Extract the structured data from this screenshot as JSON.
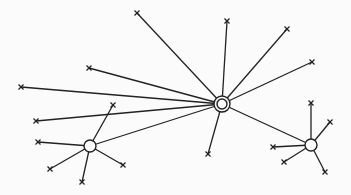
{
  "diagram": {
    "type": "hub-and-spoke network",
    "colors": {
      "stroke": "#222222",
      "background": "#fbfbfb"
    },
    "hubs": [
      {
        "id": "central",
        "x": 222,
        "y": 104,
        "style": "double-circle"
      },
      {
        "id": "left",
        "x": 90,
        "y": 146,
        "style": "circle"
      },
      {
        "id": "right",
        "x": 311,
        "y": 145,
        "style": "circle"
      }
    ],
    "edges": [
      {
        "from": "central",
        "to": [
          137,
          13
        ]
      },
      {
        "from": "central",
        "to": [
          89,
          68
        ]
      },
      {
        "from": "central",
        "to": [
          21,
          87
        ]
      },
      {
        "from": "central",
        "to": [
          36,
          121
        ]
      },
      {
        "from": "central",
        "to": [
          227,
          21
        ]
      },
      {
        "from": "central",
        "to": [
          287,
          29
        ]
      },
      {
        "from": "central",
        "to": [
          312,
          62
        ]
      },
      {
        "from": "central",
        "to": [
          208,
          154
        ]
      },
      {
        "from": "central",
        "to": "left"
      },
      {
        "from": "central",
        "to": "right"
      },
      {
        "from": "left",
        "to": [
          113,
          105
        ]
      },
      {
        "from": "left",
        "to": [
          38,
          142
        ]
      },
      {
        "from": "left",
        "to": [
          50,
          169
        ]
      },
      {
        "from": "left",
        "to": [
          82,
          182
        ]
      },
      {
        "from": "left",
        "to": [
          123,
          165
        ]
      },
      {
        "from": "right",
        "to": [
          311,
          103
        ]
      },
      {
        "from": "right",
        "to": [
          330,
          122
        ]
      },
      {
        "from": "right",
        "to": [
          273,
          147
        ]
      },
      {
        "from": "right",
        "to": [
          284,
          162
        ]
      },
      {
        "from": "right",
        "to": [
          325,
          172
        ]
      }
    ]
  }
}
